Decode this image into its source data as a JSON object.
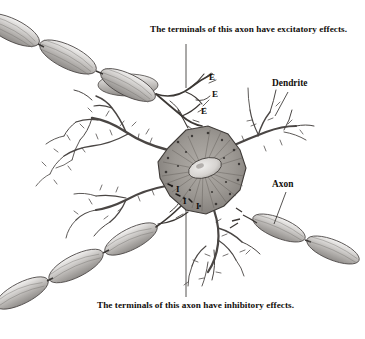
{
  "figure": {
    "name": "neuron-diagram",
    "background_color": "#ffffff",
    "ink_color": "#262220",
    "soma_fill": "#9a9691",
    "myelin_fill": "#c8c6c3"
  },
  "captions": {
    "excitatory": "The terminals of this axon have excitatory effects.",
    "inhibitory": "The terminals of this axon have inhibitory effects."
  },
  "labels": {
    "dendrite": "Dendrite",
    "axon": "Axon"
  },
  "markers": {
    "excitatory": [
      "E",
      "E",
      "E"
    ],
    "inhibitory": [
      "I",
      "I",
      "I"
    ]
  }
}
